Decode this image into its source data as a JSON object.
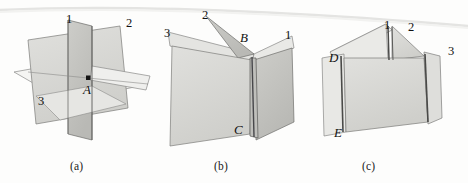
{
  "figure": {
    "kind": "geometry-figure",
    "background_color": "#fdfdfc",
    "page_edge_color": "#e3e3e1",
    "plane_fill_light": "#e9e9e7",
    "plane_fill_mid": "#d7d7d4",
    "plane_fill_dark": "#c3c3c0",
    "outline_color": "#6e6e6c",
    "accent_edge_color": "#4a4a48",
    "panels": [
      {
        "id": "a",
        "caption": "(a)",
        "labels": [
          {
            "id": "a-plane-1",
            "text": "1",
            "style": "upright",
            "x": 66,
            "y": 12
          },
          {
            "id": "a-plane-2",
            "text": "2",
            "style": "upright",
            "x": 126,
            "y": 16
          },
          {
            "id": "a-plane-3",
            "text": "3",
            "style": "upright",
            "x": 38,
            "y": 94
          },
          {
            "id": "a-point-A",
            "text": "A",
            "style": "italic",
            "x": 83,
            "y": 82
          }
        ],
        "point_markers": [
          {
            "id": "A",
            "x": 88,
            "y": 78
          }
        ]
      },
      {
        "id": "b",
        "caption": "(b)",
        "labels": [
          {
            "id": "b-plane-2",
            "text": "2",
            "style": "upright",
            "x": 202,
            "y": 8
          },
          {
            "id": "b-plane-3",
            "text": "3",
            "style": "upright",
            "x": 164,
            "y": 26
          },
          {
            "id": "b-plane-1",
            "text": "1",
            "style": "upright",
            "x": 285,
            "y": 28
          },
          {
            "id": "b-point-B",
            "text": "B",
            "style": "italic",
            "x": 240,
            "y": 30
          },
          {
            "id": "b-point-C",
            "text": "C",
            "style": "italic",
            "x": 234,
            "y": 122
          }
        ],
        "point_markers": []
      },
      {
        "id": "c",
        "caption": "(c)",
        "labels": [
          {
            "id": "c-plane-1",
            "text": "1",
            "style": "upright",
            "x": 384,
            "y": 18
          },
          {
            "id": "c-plane-2",
            "text": "2",
            "style": "upright",
            "x": 408,
            "y": 20
          },
          {
            "id": "c-plane-3",
            "text": "3",
            "style": "upright",
            "x": 448,
            "y": 44
          },
          {
            "id": "c-point-D",
            "text": "D",
            "style": "italic",
            "x": 329,
            "y": 50
          },
          {
            "id": "c-point-E",
            "text": "E",
            "style": "italic",
            "x": 334,
            "y": 125
          }
        ],
        "point_markers": []
      }
    ],
    "captions": [
      {
        "id": "caption-a",
        "text": "(a)",
        "x": 70,
        "y": 160
      },
      {
        "id": "caption-b",
        "text": "(b)",
        "x": 214,
        "y": 160
      },
      {
        "id": "caption-c",
        "text": "(c)",
        "x": 362,
        "y": 160
      }
    ]
  }
}
